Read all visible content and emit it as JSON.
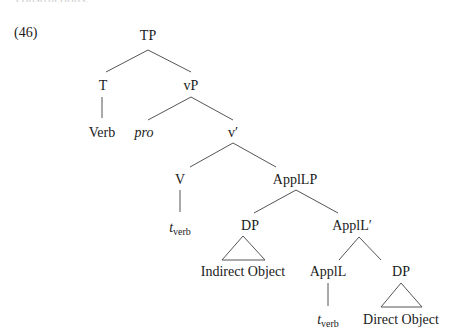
{
  "cutoff_text": "constructions:",
  "example_number": "(46)",
  "tree": {
    "nodes": {
      "TP": "TP",
      "T": "T",
      "vP": "vP",
      "Verb": "Verb",
      "pro": "pro",
      "v_bar": "v′",
      "V": "V",
      "ApplLP": "ApplLP",
      "t_verb_1": "t",
      "t_verb_1_sub": "verb",
      "DP_indirect": "DP",
      "ApplL_bar": "ApplL′",
      "indirect_object": "Indirect Object",
      "ApplL": "ApplL",
      "DP_direct": "DP",
      "t_verb_2": "t",
      "t_verb_2_sub": "verb",
      "direct_object": "Direct Object"
    },
    "line_color": "#555555"
  }
}
